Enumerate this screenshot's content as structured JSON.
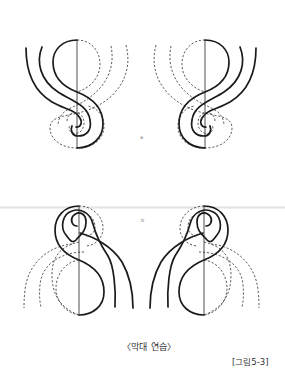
{
  "figure": {
    "panels": [
      {
        "label": "a",
        "description": "Stick (stroke) practice, spiral at bottom, left and mirrored right"
      },
      {
        "label": "b",
        "description": "Stick (stroke) practice, spiral at top, left and mirrored right"
      }
    ],
    "caption": "〈막대 연습〉",
    "figure_number": "[그림5-3]"
  },
  "colors": {
    "stroke": "#1a1a1a",
    "background": "#ffffff"
  }
}
